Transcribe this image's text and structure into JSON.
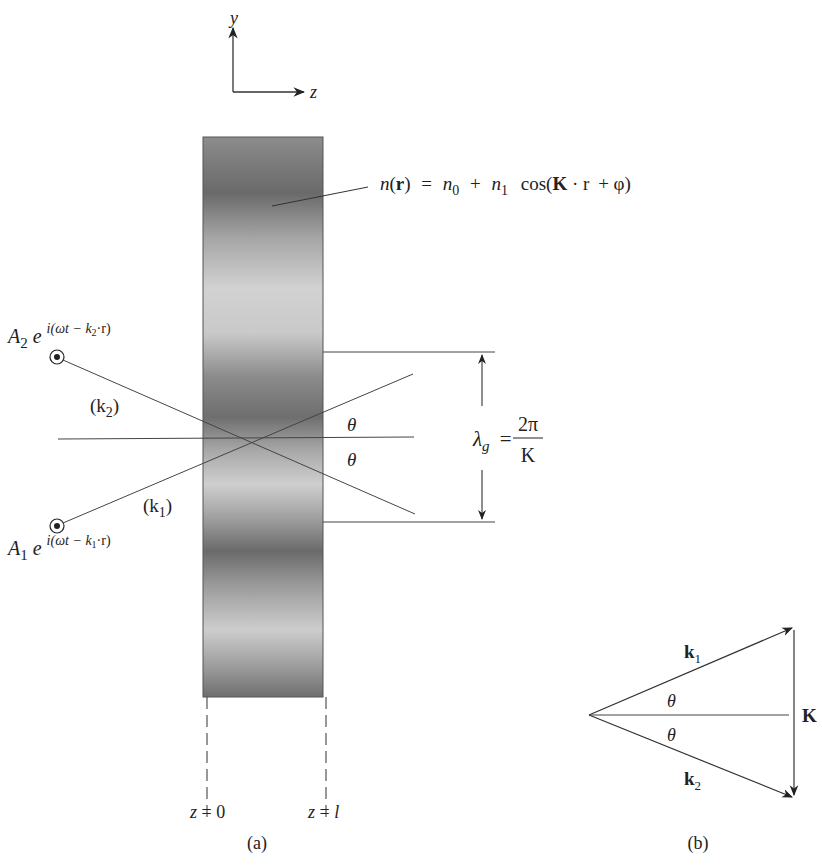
{
  "figure": {
    "axes": {
      "y_label": "y",
      "z_label": "z"
    },
    "index_formula": {
      "lhs_n": "n",
      "lhs_arg": "(r)",
      "eq": "=",
      "n0": "n",
      "n0_sub": "0",
      "plus": "+",
      "n1": "n",
      "n1_sub": "1",
      "cos": "cos(",
      "K": "K",
      "dot_r": "· r",
      "plus_phi": "+ φ)"
    },
    "wave2": {
      "amp": "A",
      "amp_sub": "2",
      "e": "e",
      "exponent": "i(ωt − k",
      "exponent_sub": "2",
      "exponent_end": "·r)",
      "label": "(k",
      "label_sub": "2",
      "label_end": ")"
    },
    "wave1": {
      "amp": "A",
      "amp_sub": "1",
      "e": "e",
      "exponent": "i(ωt − k",
      "exponent_sub": "1",
      "exponent_end": "·r)",
      "label": "(k",
      "label_sub": "1",
      "label_end": ")"
    },
    "theta_upper": "θ",
    "theta_lower": "θ",
    "grating_period": {
      "lambda": "λ",
      "lambda_sub": "g",
      "eq": "=",
      "numerator": "2π",
      "denominator": "K"
    },
    "boundaries": {
      "left": "z = 0",
      "right_prefix": "z =",
      "right_var": "l"
    },
    "caption_a": "(a)",
    "vector_diagram": {
      "k1": "k",
      "k1_sub": "1",
      "k2": "k",
      "k2_sub": "2",
      "K": "K",
      "theta_upper": "θ",
      "theta_lower": "θ"
    },
    "caption_b": "(b)"
  }
}
